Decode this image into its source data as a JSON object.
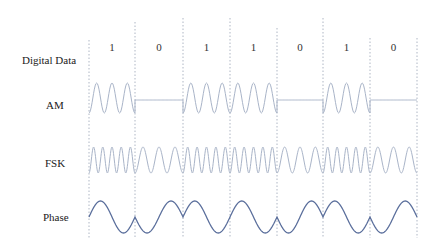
{
  "rows": [
    {
      "id": "digital",
      "label": "Digital Data",
      "x": 22,
      "y": 62
    },
    {
      "id": "am",
      "label": "AM",
      "x": 46,
      "y": 107
    },
    {
      "id": "fsk",
      "label": "FSK",
      "x": 45,
      "y": 165
    },
    {
      "id": "phase",
      "label": "Phase",
      "x": 43,
      "y": 219
    }
  ],
  "bits": [
    "1",
    "0",
    "1",
    "1",
    "0",
    "1",
    "0"
  ],
  "boundaries_x": [
    89,
    135,
    183,
    230,
    277,
    323,
    370,
    417
  ],
  "boundary_tops": [
    40,
    22,
    18,
    18,
    28,
    18,
    38,
    38
  ],
  "bit_label_y": 49,
  "colors": {
    "am": "#a9b4c8",
    "fsk": "#a9b4c8",
    "phase": "#5b6f9c",
    "grid": "#9aa3b5"
  },
  "am": {
    "top": 83,
    "bottom": 113,
    "flat_y": 100,
    "cycles_per_one": 3
  },
  "fsk": {
    "top": 147,
    "bottom": 173,
    "cycles_one": 5,
    "cycles_zero": 3
  },
  "phase": {
    "top": 201,
    "bottom": 233,
    "cycles_per_bit": 1
  }
}
